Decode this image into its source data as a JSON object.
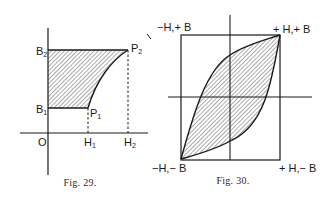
{
  "figures": [
    {
      "id": "fig29",
      "caption": "Fig. 29.",
      "labels": {
        "origin": "O",
        "b1": "B",
        "b1_sub": "1",
        "b2": "B",
        "b2_sub": "2",
        "h1": "H",
        "h1_sub": "1",
        "h2": "H",
        "h2_sub": "2",
        "p1": "P",
        "p1_sub": "1",
        "p2": "P",
        "p2_sub": "2"
      },
      "description": "Shaded area bounded by B2-P2 horizontal, curve P1-P2, B1-P1 horizontal and B axis"
    },
    {
      "id": "fig30",
      "caption": "Fig. 30.",
      "labels": {
        "top_left": "−H,+ B",
        "top_right": "+ H,+ B",
        "bottom_left": "−H,− B",
        "bottom_right": "+ H,− B"
      },
      "description": "Hysteresis loop inside rectangle with crossing axes; shaded loop between opposite corners"
    }
  ],
  "colors": {
    "ink": "#1a1a1a",
    "hatch": "#555555",
    "background": "#ffffff"
  }
}
